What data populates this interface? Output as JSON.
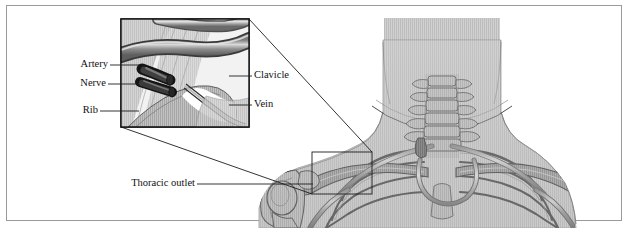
{
  "figure": {
    "style": "grayscale medical line illustration with engraved hatching",
    "background_color": "#ffffff",
    "frame_color": "#9a9a9a",
    "line_color": "#1a1a1a",
    "body_fill": "#c9c9c9",
    "bone_fill": "#b5b5b5",
    "vessel_fill": "#9c9c9c"
  },
  "inset": {
    "name": "magnified-detail-box",
    "border_color": "#111111",
    "x": 121,
    "y": 19,
    "width": 128,
    "height": 108,
    "caption": "Magnified view of the costoclavicular space"
  },
  "callout": {
    "name": "magnified-region-marker",
    "x": 312,
    "y": 152,
    "width": 60,
    "height": 42
  },
  "labels": [
    {
      "id": "artery",
      "text": "Artery",
      "align": "right",
      "x": 76,
      "y": 62,
      "leader_to_x": 139,
      "leader_to_y": 65
    },
    {
      "id": "nerve",
      "text": "Nerve",
      "align": "right",
      "x": 76,
      "y": 80,
      "leader_to_x": 139,
      "leader_to_y": 84
    },
    {
      "id": "rib",
      "text": "Rib",
      "align": "right",
      "x": 76,
      "y": 108,
      "leader_to_x": 139,
      "leader_to_y": 111
    },
    {
      "id": "clavicle",
      "text": "Clavicle",
      "align": "left",
      "x": 254,
      "y": 73,
      "leader_to_x": 229,
      "leader_to_y": 76
    },
    {
      "id": "vein",
      "text": "Vein",
      "align": "left",
      "x": 254,
      "y": 102,
      "leader_to_x": 229,
      "leader_to_y": 105
    },
    {
      "id": "thoracic-outlet",
      "text": "Thoracic outlet",
      "align": "right",
      "x": 192,
      "y": 182,
      "leader_to_x": 313,
      "leader_to_y": 184
    }
  ]
}
